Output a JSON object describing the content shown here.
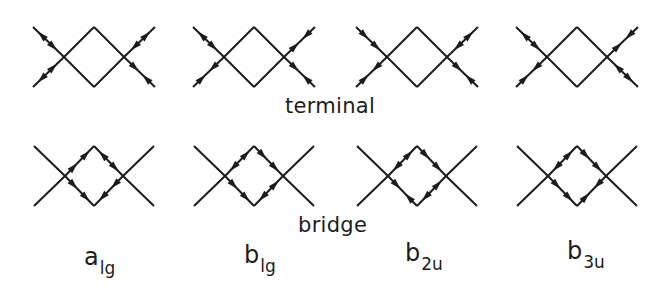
{
  "figure": {
    "row_labels": {
      "terminal": "terminal",
      "bridge": "bridge"
    },
    "columns": [
      {
        "symbol": "a",
        "subscript": "lg",
        "center_x": 94
      },
      {
        "symbol": "b",
        "subscript": "lg",
        "center_x": 254
      },
      {
        "symbol": "b",
        "subscript": "2u",
        "center_x": 417
      },
      {
        "symbol": "b",
        "subscript": "3u",
        "center_x": 577
      }
    ],
    "line_color": "#1c1c1c"
  }
}
